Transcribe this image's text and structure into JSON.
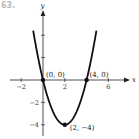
{
  "corner_label": "63.",
  "chart_data": {
    "type": "line",
    "title": "",
    "function": "y = x^2 - 4x",
    "xlabel": "x",
    "ylabel": "y",
    "xlim": [
      -2.9,
      8.5
    ],
    "ylim": [
      -5,
      6.2
    ],
    "grid": false,
    "x_ticks": [
      -2,
      2,
      6
    ],
    "y_ticks": [
      -4,
      -2,
      2,
      4
    ],
    "x_tick_labels": [
      "-2",
      "2",
      "6"
    ],
    "y_tick_labels": [
      "−4",
      "−2"
    ],
    "series": [
      {
        "name": "parabola",
        "x": [
          -0.9,
          -0.5,
          0,
          0.5,
          1,
          1.5,
          2,
          2.5,
          3,
          3.5,
          4,
          4.5,
          4.9
        ],
        "values": [
          4.41,
          2.25,
          0,
          -1.75,
          -3,
          -3.75,
          -4,
          -3.75,
          -3,
          -1.75,
          0,
          2.25,
          4.41
        ]
      }
    ],
    "points": [
      {
        "x": 0,
        "y": 0,
        "label": "(0, 0)"
      },
      {
        "x": 4,
        "y": 0,
        "label": "(4, 0)"
      },
      {
        "x": 2,
        "y": -4,
        "label": "(2, −4)"
      }
    ]
  }
}
